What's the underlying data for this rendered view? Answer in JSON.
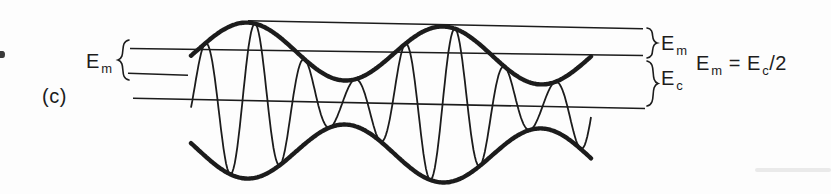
{
  "colors": {
    "ink": "#1c1c1c",
    "background": "#fdfdfd"
  },
  "figure_label": "(c)",
  "labels": {
    "em_left": {
      "base": "E",
      "sub": "m"
    },
    "em_right": {
      "base": "E",
      "sub": "m"
    },
    "ec_right": {
      "base": "E",
      "sub": "c"
    }
  },
  "equation": {
    "lhs_base": "E",
    "lhs_sub": "m",
    "relation": "=",
    "rhs_base": "E",
    "rhs_sub": "c",
    "rhs_suffix": "/2"
  },
  "waveform": {
    "type": "amplitude-modulated-sine",
    "x_start": 191,
    "x_end": 592,
    "carrier_amplitude": 50,
    "modulation_depth": 28,
    "carrier_period": 50,
    "carrier_peak_x": 205,
    "envelope_crest_x": 247,
    "envelope_period": 196,
    "center_axis": {
      "x1": 133,
      "y1": 98.3,
      "x2": 645,
      "y2": 108.5
    }
  },
  "reference_lines": [
    {
      "name": "envelope-max-line",
      "x1": 248,
      "y1": 20.7,
      "x2": 643,
      "y2": 28.7
    },
    {
      "name": "carrier-peak-line",
      "x1": 130,
      "y1": 48.5,
      "x2": 643,
      "y2": 55.5
    },
    {
      "name": "envelope-min-line",
      "x1": 128,
      "y1": 73.3,
      "x2": 188,
      "y2": 75.3
    },
    {
      "name": "center-line",
      "x1": 133,
      "y1": 98.3,
      "x2": 645,
      "y2": 108.5
    }
  ],
  "braces": [
    {
      "name": "em-left-brace",
      "x": 129,
      "y1": 40,
      "y2": 80,
      "depth": 11,
      "dir": -1
    },
    {
      "name": "em-right-brace",
      "x": 647,
      "y1": 28,
      "y2": 58,
      "depth": 10,
      "dir": 1
    },
    {
      "name": "ec-right-brace",
      "x": 647,
      "y1": 61,
      "y2": 106,
      "depth": 11,
      "dir": 1
    }
  ]
}
